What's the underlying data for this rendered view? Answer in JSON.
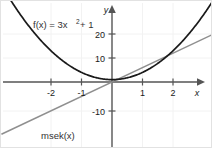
{
  "chart_data": {
    "type": "line",
    "title": "",
    "xlabel": "x",
    "ylabel": "y",
    "xlim": [
      -3.6,
      3.2
    ],
    "ylim": [
      -13,
      28
    ],
    "grid": true,
    "legend": "inline-labels",
    "xticks": [
      -2,
      -1,
      1,
      2
    ],
    "xtick_labels": [
      "-2",
      "-1",
      "1",
      "2"
    ],
    "yticks": [
      20,
      10,
      -10
    ],
    "ytick_labels": [
      "20",
      "10",
      "-10"
    ],
    "series": [
      {
        "name": "f(x) = 3x^2 + 1",
        "type": "parabola",
        "color": "#1a1a1a",
        "a": 3,
        "b": 0,
        "c": 1,
        "label_parts": {
          "prefix": "f(x) = 3x",
          "exponent": "2",
          "suffix": "+ 1"
        },
        "points": [
          {
            "x": -3.0,
            "y": 28
          },
          {
            "x": -2.0,
            "y": 13
          },
          {
            "x": -1.0,
            "y": 4
          },
          {
            "x": 0.0,
            "y": 1
          },
          {
            "x": 1.0,
            "y": 4
          },
          {
            "x": 2.0,
            "y": 13
          },
          {
            "x": 3.0,
            "y": 28
          }
        ]
      },
      {
        "name": "msek(x)",
        "type": "secant-line",
        "color": "#8a8a8a",
        "slope": 6,
        "intercept": 0,
        "label": "msek(x)",
        "points": [
          {
            "x": -3.3,
            "y": -19.8
          },
          {
            "x": 0.0,
            "y": 0
          },
          {
            "x": 3.2,
            "y": 19.2
          }
        ]
      }
    ],
    "axes_color": "#555555",
    "grid_color": "#f0f0f0",
    "background": "#ffffff"
  },
  "labels": {
    "function_label_prefix": "f(x) = 3x",
    "function_label_exponent": "2",
    "function_label_suffix": "+ 1",
    "secant_label": "msek(x)",
    "x_axis_name": "x",
    "y_axis_name": "y",
    "xtick_neg2": "-2",
    "xtick_neg1": "-1",
    "xtick_pos1": "1",
    "xtick_pos2": "2",
    "ytick_20": "20",
    "ytick_10": "10",
    "ytick_neg10": "-10"
  }
}
